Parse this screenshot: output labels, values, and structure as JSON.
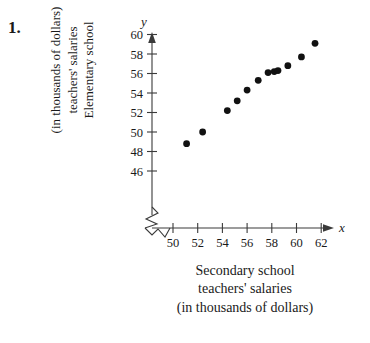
{
  "problem": {
    "number": "1."
  },
  "axis_titles": {
    "y_lines": [
      "Elementary school",
      "teachers' salaries",
      "(in thousands of dollars)"
    ],
    "x_lines": [
      "Secondary school",
      "teachers' salaries",
      "(in thousands of dollars)"
    ],
    "y_var": "y",
    "x_var": "x"
  },
  "chart_data": {
    "type": "scatter",
    "title": "",
    "xlabel": "Secondary school teachers' salaries (in thousands of dollars)",
    "ylabel": "Elementary school teachers' salaries (in thousands of dollars)",
    "xlim": [
      49.0,
      62.8
    ],
    "ylim": [
      45.0,
      60.8
    ],
    "xticks": [
      50,
      52,
      54,
      56,
      58,
      60,
      62
    ],
    "yticks": [
      46,
      48,
      50,
      52,
      54,
      56,
      58,
      60
    ],
    "xtick_labels": [
      "50",
      "52",
      "54",
      "56",
      "58",
      "60",
      "62"
    ],
    "ytick_labels": [
      "46",
      "48",
      "50",
      "52",
      "54",
      "56",
      "58",
      "60"
    ],
    "axis_break": true,
    "axis_break_axis": "both-origin",
    "grid": false,
    "legend": false,
    "marker": "filled-circle",
    "marker_color": "#111111",
    "points": [
      {
        "x": 51.1,
        "y": 48.8
      },
      {
        "x": 52.4,
        "y": 50.0
      },
      {
        "x": 54.4,
        "y": 52.2
      },
      {
        "x": 55.2,
        "y": 53.2
      },
      {
        "x": 56.0,
        "y": 54.3
      },
      {
        "x": 56.9,
        "y": 55.3
      },
      {
        "x": 57.7,
        "y": 56.1
      },
      {
        "x": 58.2,
        "y": 56.2
      },
      {
        "x": 58.5,
        "y": 56.3
      },
      {
        "x": 59.3,
        "y": 56.8
      },
      {
        "x": 60.4,
        "y": 57.7
      },
      {
        "x": 61.5,
        "y": 59.1
      }
    ]
  }
}
